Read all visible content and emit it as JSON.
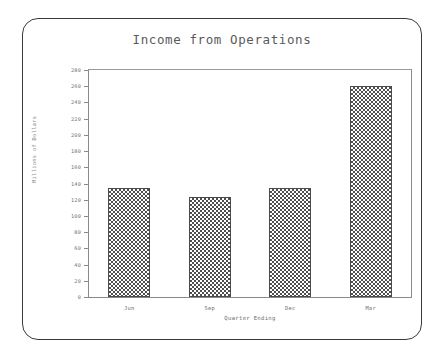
{
  "chart_data": {
    "type": "bar",
    "title": "Income from Operations",
    "xlabel": "Quarter Ending",
    "ylabel": "Millions of Dollars",
    "categories": [
      "Jun",
      "Sep",
      "Dec",
      "Mar"
    ],
    "values": [
      135,
      123,
      135,
      260
    ],
    "ylim": [
      0,
      280
    ],
    "ytick_values": [
      0,
      20,
      40,
      60,
      80,
      100,
      120,
      140,
      160,
      180,
      200,
      220,
      240,
      260,
      280
    ],
    "ytick_labels": [
      "0",
      "20",
      "40",
      "60",
      "80",
      "100",
      "120",
      "140",
      "160",
      "180",
      "200",
      "220",
      "240",
      "260",
      "280"
    ],
    "grid": false,
    "legend": null,
    "bar_fill": "checkerboard-dither",
    "colors": {
      "bar_fill": "#4f4f4f",
      "bar_edge": "#4a4a4a",
      "axis": "#8a8a8a",
      "title_text": "#5a5a5a",
      "tick_text": "#6e6e6e",
      "frame": "#3a3a3a",
      "background": "#ffffff"
    }
  }
}
